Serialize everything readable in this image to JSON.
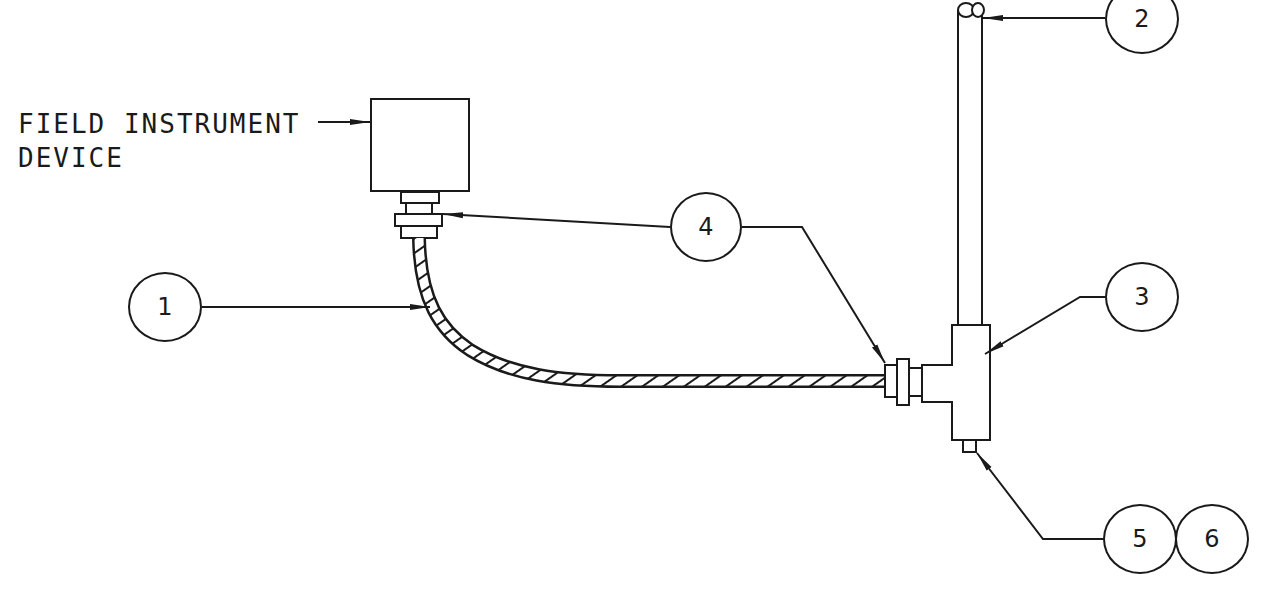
{
  "diagram": {
    "type": "instrument installation detail",
    "labels": {
      "device_line1": "FIELD INSTRUMENT",
      "device_line2": "DEVICE"
    },
    "balloons": [
      {
        "id": "1",
        "text": "1",
        "points_to": "flexible conduit"
      },
      {
        "id": "2",
        "text": "2",
        "points_to": "vertical rigid conduit / pipe"
      },
      {
        "id": "3",
        "text": "3",
        "points_to": "tee fitting"
      },
      {
        "id": "4",
        "text": "4",
        "points_to": "connectors at both ends of flexible conduit"
      },
      {
        "id": "5",
        "text": "5",
        "points_to": "bottom drain / plug of tee"
      },
      {
        "id": "6",
        "text": "6",
        "points_to": "bottom drain / plug of tee"
      }
    ],
    "colors": {
      "line": "#1a1a1a",
      "background": "#ffffff"
    }
  }
}
